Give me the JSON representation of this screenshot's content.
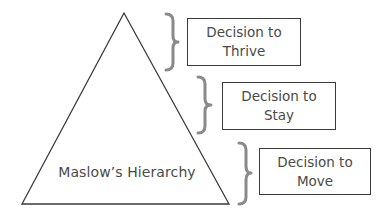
{
  "diagram": {
    "pyramid": {
      "label": "Maslow’s Hierarchy",
      "stroke_color": "#3a3a3a"
    },
    "brace_color": "#8a8a8a",
    "decisions": [
      {
        "line1": "Decision to",
        "line2": "Thrive"
      },
      {
        "line1": "Decision to",
        "line2": "Stay"
      },
      {
        "line1": "Decision to",
        "line2": "Move"
      }
    ]
  }
}
